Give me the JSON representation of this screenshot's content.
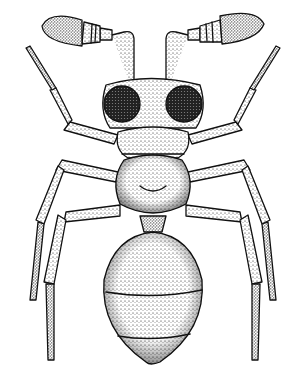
{
  "image": {
    "description": "Stippled black-and-white dorsal-view scientific illustration of an ant-like insect",
    "subject": "insect",
    "view": "dorsal",
    "style": "stipple pen-and-ink",
    "colors": {
      "ink": "#111111",
      "paper": "#ffffff"
    },
    "parts": [
      "antennae",
      "head",
      "compound-eyes",
      "pronotum",
      "mesosoma",
      "petiole",
      "gaster",
      "legs"
    ]
  }
}
